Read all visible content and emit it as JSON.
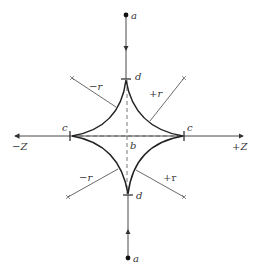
{
  "diagram": {
    "type": "astroid-field-diagram",
    "colors": {
      "line": "#333333",
      "curve": "#222222",
      "dashed": "#555555"
    },
    "labels": {
      "a_top": "a",
      "a_bottom": "a",
      "d_top": "d",
      "d_bottom": "d",
      "c_left": "c",
      "c_right": "c",
      "b_center": "b",
      "minus_z": "−Z",
      "plus_z": "+Z",
      "minus_r_upper": "−r",
      "plus_r_upper": "+r",
      "minus_r_lower": "−r",
      "plus_r_lower": "+r"
    }
  }
}
